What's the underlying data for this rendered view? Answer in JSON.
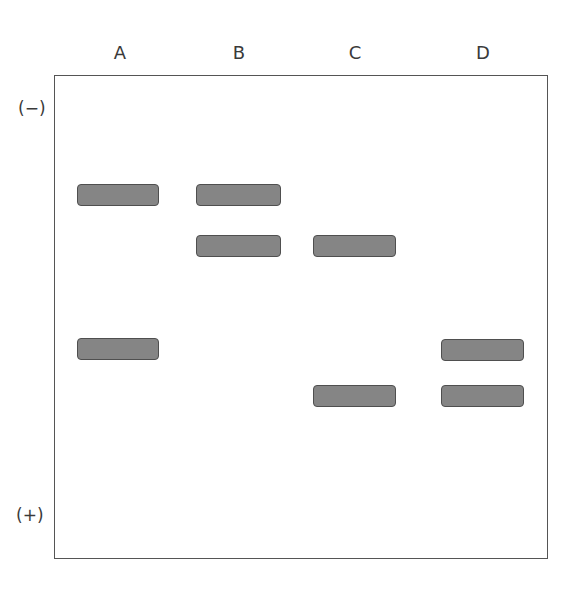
{
  "lanes": [
    "A",
    "B",
    "C",
    "D"
  ],
  "poles": {
    "negative": "(−)",
    "positive": "(+)"
  },
  "bands": [
    {
      "lane": "A",
      "x": 77,
      "y": 184,
      "w": 82
    },
    {
      "lane": "A",
      "x": 77,
      "y": 338,
      "w": 82
    },
    {
      "lane": "B",
      "x": 196,
      "y": 184,
      "w": 85
    },
    {
      "lane": "B",
      "x": 196,
      "y": 235,
      "w": 85
    },
    {
      "lane": "C",
      "x": 313,
      "y": 235,
      "w": 83
    },
    {
      "lane": "C",
      "x": 313,
      "y": 385,
      "w": 83
    },
    {
      "lane": "D",
      "x": 441,
      "y": 339,
      "w": 83
    },
    {
      "lane": "D",
      "x": 441,
      "y": 385,
      "w": 83
    }
  ],
  "colors": {
    "band_fill": "#858585",
    "band_border": "#4f4f4f",
    "frame": "#555555"
  }
}
